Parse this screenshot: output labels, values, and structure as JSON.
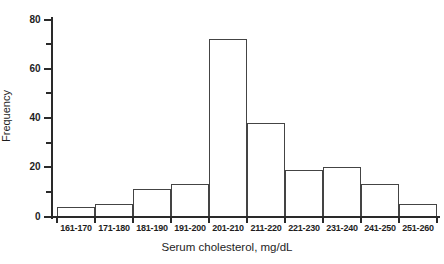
{
  "figure": {
    "background": "#ffffff",
    "line_color": "#2a2a2a",
    "bar_border_color": "#444444",
    "text_color": "#1e1e1e"
  },
  "chart_data": {
    "type": "bar",
    "subtype": "histogram",
    "title": "",
    "xlabel": "Serum cholesterol, mg/dL",
    "ylabel": "Frequency",
    "categories": [
      "161-170",
      "171-180",
      "181-190",
      "191-200",
      "201-210",
      "211-220",
      "221-230",
      "231-240",
      "241-250",
      "251-260"
    ],
    "values": [
      4,
      5,
      11,
      13,
      72,
      38,
      19,
      20,
      13,
      5
    ],
    "ylim": [
      0,
      80
    ],
    "y_major_ticks": [
      0,
      20,
      40,
      60,
      80
    ],
    "y_minor_ticks": [
      10,
      30,
      50,
      70
    ],
    "grid": false,
    "legend": "none",
    "bar_fill": "#ffffff"
  }
}
